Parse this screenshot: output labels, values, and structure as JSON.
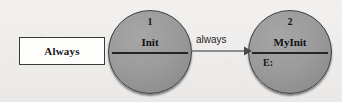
{
  "diagram": {
    "background_color": "#f1efed",
    "note_box": {
      "label": "Always",
      "fill_color": "#fdfdfc",
      "border_color": "#3a3a38"
    },
    "states": [
      {
        "number": "1",
        "name": "Init",
        "compartment": "",
        "fill_color": "#9b9b9b",
        "border_color": "#3b3b3b"
      },
      {
        "number": "2",
        "name": "MyInit",
        "compartment": "E:",
        "fill_color": "#9b9b9b",
        "border_color": "#3b3b3b"
      }
    ],
    "transitions": [
      {
        "label": "always",
        "from": "Init",
        "to": "MyInit",
        "line_color": "#6e6e70"
      }
    ]
  }
}
